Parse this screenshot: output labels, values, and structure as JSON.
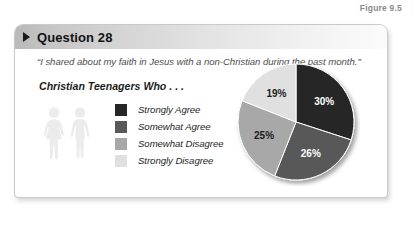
{
  "figure": {
    "label": "Figure 9.5"
  },
  "card": {
    "header": {
      "arrow_icon": "triangle-right-icon",
      "title": "Question 28"
    },
    "quote": "“I shared about my faith in Jesus with a non-Christian during the past month.”",
    "subhead": "Christian Teenagers Who . . .",
    "people_icon": "two-people-icon"
  },
  "legend": {
    "items": [
      {
        "label": "Strongly Agree",
        "color": "#272727"
      },
      {
        "label": "Somewhat Agree",
        "color": "#595959"
      },
      {
        "label": "Somewhat Disagree",
        "color": "#a8a8a8"
      },
      {
        "label": "Strongly Disagree",
        "color": "#e0e0e0"
      }
    ]
  },
  "chart_data": {
    "type": "pie",
    "title": "Christian Teenagers Who . . .",
    "labels": [
      "Strongly Agree",
      "Somewhat Agree",
      "Somewhat Disagree",
      "Strongly Disagree"
    ],
    "values": [
      30,
      26,
      25,
      19
    ],
    "value_labels": [
      "30%",
      "26%",
      "25%",
      "19%"
    ],
    "colors": [
      "#272727",
      "#595959",
      "#a8a8a8",
      "#e0e0e0"
    ],
    "units": "percent",
    "start_angle_deg": 0,
    "direction": "clockwise",
    "legend_position": "left",
    "label_text_colors": [
      "#ffffff",
      "#ffffff",
      "#1c1c1c",
      "#1c1c1c"
    ]
  }
}
